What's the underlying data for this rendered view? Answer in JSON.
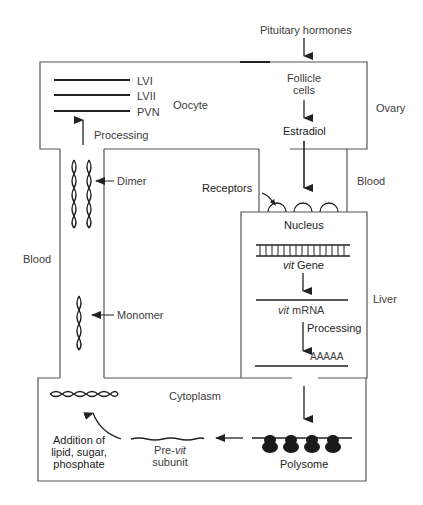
{
  "diagram": {
    "inputs": {
      "pituitary": "Pituitary hormones"
    },
    "ovary": {
      "region_label": "Ovary",
      "oocyte": {
        "label": "Oocyte",
        "products": [
          "LVI",
          "LVII",
          "PVN"
        ],
        "processing_label": "Processing"
      },
      "follicle": {
        "label_line1": "Follicle",
        "label_line2": "cells",
        "hormone": "Estradiol"
      }
    },
    "blood": {
      "left_label": "Blood",
      "right_label": "Blood",
      "dimer_label": "Dimer",
      "monomer_label": "Monomer"
    },
    "liver": {
      "region_label": "Liver",
      "receptors_label": "Receptors",
      "nucleus_label": "Nucleus",
      "gene_italic": "vit",
      "gene_rest": " Gene",
      "mrna_italic": "vit",
      "mrna_rest": " mRNA",
      "processing_label": "Processing",
      "polya": "AAAAA"
    },
    "cytoplasm": {
      "label": "Cytoplasm",
      "polysome_label": "Polysome",
      "previt_prefix": "Pre-",
      "previt_italic": "vit",
      "previt_line2": "subunit",
      "addition_lines": [
        "Addition of",
        "lipid, sugar,",
        "phosphate"
      ]
    },
    "colors": {
      "line": "#444444",
      "text": "#3c3c3c",
      "dark": "#1e1e1e"
    }
  }
}
